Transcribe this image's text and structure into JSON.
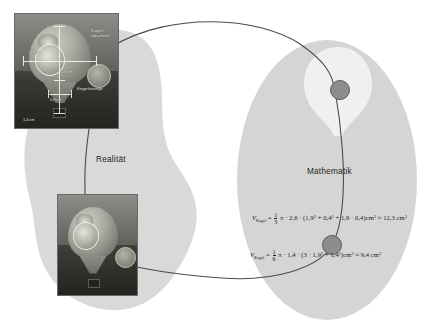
{
  "diagram": {
    "regions": [
      {
        "id": "reality",
        "label": "Realität",
        "fill": "#d9d9d9"
      },
      {
        "id": "mathematics",
        "label": "Mathematik",
        "fill": "#d5d5d5",
        "highlight_fill": "#f0f0f0"
      }
    ],
    "connector_color": "#4a4a4a",
    "node_color": "#8d8d8d",
    "node_border": "#5b5b5b"
  },
  "photos": {
    "top": {
      "name": "annotated-balloon-photo",
      "annotations": {
        "upper_right": "Kugel-\nabschnitt",
        "lower_right": "Kegelstumpf",
        "dim_width": "3,8 cm",
        "dim_height": "2,6 cm",
        "dim_small": "0,8 cm",
        "dim_bottom": "1,4 cm"
      }
    },
    "bottom": {
      "name": "plain-balloon-photo",
      "annotations": {}
    }
  },
  "formulas": [
    {
      "id": "frustum",
      "var": "V",
      "subscript": "Kegel",
      "relation": "=",
      "fraction_num": "1",
      "fraction_den": "3",
      "body_a": "π · 2,6 · (1,9",
      "exp_a": "2",
      "body_b": " + 0,4",
      "exp_b": "2",
      "body_c": " + 1,9 · 0,4)cm",
      "exp_c": "3",
      "approx": "≈ 12,3 cm",
      "exp_result": "3"
    },
    {
      "id": "spherical-cap",
      "var": "V",
      "subscript": "Kugel",
      "relation": "=",
      "fraction_num": "1",
      "fraction_den": "6",
      "body_a": "π · 1,4 · (3 · 1,9",
      "exp_a": "2",
      "body_b": " + 1,4",
      "exp_b": "2",
      "body_c": ")cm",
      "exp_c": "3",
      "approx": "≈ 9,4 cm",
      "exp_result": "3"
    }
  ]
}
